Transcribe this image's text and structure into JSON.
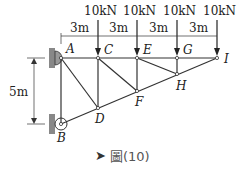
{
  "diagram": {
    "type": "truss",
    "loads": [
      {
        "node": "C",
        "label": "10kN"
      },
      {
        "node": "E",
        "label": "10kN"
      },
      {
        "node": "G",
        "label": "10kN"
      },
      {
        "node": "I",
        "label": "10kN"
      }
    ],
    "spacings": [
      "3m",
      "3m",
      "3m",
      "3m"
    ],
    "height_label": "5m",
    "nodes": {
      "A": "A",
      "B": "B",
      "C": "C",
      "D": "D",
      "E": "E",
      "F": "F",
      "G": "G",
      "H": "H",
      "I": "I"
    },
    "members": [
      [
        "A",
        "C"
      ],
      [
        "C",
        "E"
      ],
      [
        "E",
        "G"
      ],
      [
        "G",
        "I"
      ],
      [
        "B",
        "D"
      ],
      [
        "D",
        "F"
      ],
      [
        "F",
        "H"
      ],
      [
        "H",
        "I"
      ],
      [
        "A",
        "B"
      ],
      [
        "C",
        "D"
      ],
      [
        "E",
        "F"
      ],
      [
        "G",
        "H"
      ],
      [
        "A",
        "D"
      ],
      [
        "C",
        "F"
      ],
      [
        "E",
        "H"
      ]
    ],
    "colors": {
      "line": "#333333",
      "support": "#777777"
    }
  },
  "caption": {
    "icon": "arrow-icon",
    "text": "圖(10)"
  }
}
